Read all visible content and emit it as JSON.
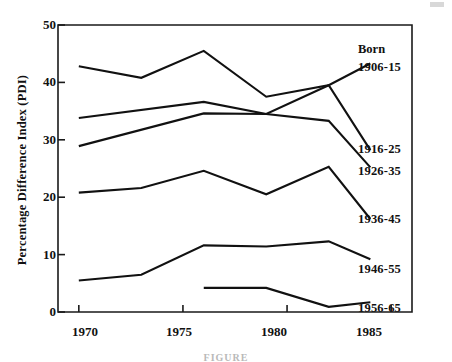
{
  "chart_data": {
    "type": "line",
    "title": "",
    "xlabel": "",
    "ylabel": "Percentage Difference Index (PDI)",
    "xlim": [
      1969,
      1986
    ],
    "ylim": [
      0,
      50
    ],
    "xticks": [
      1970,
      1975,
      1980,
      1985
    ],
    "yticks": [
      0,
      10,
      20,
      30,
      40,
      50
    ],
    "grid": false,
    "legend_position": "right-inline",
    "legend_header": "Born",
    "series": [
      {
        "name": "1906-15",
        "x": [
          1970,
          1973,
          1976,
          1979,
          1982,
          1984
        ],
        "values": [
          42.8,
          40.8,
          45.5,
          37.5,
          39.5,
          28.2
        ]
      },
      {
        "name": "1916-25",
        "x": [
          1970,
          1976,
          1979,
          1982,
          1984
        ],
        "values": [
          33.8,
          36.6,
          34.5,
          33.3,
          25.2
        ]
      },
      {
        "name": "1926-35",
        "x": [
          1970,
          1976,
          1979,
          1982,
          1984
        ],
        "values": [
          28.9,
          34.6,
          34.5,
          39.5,
          43.3
        ]
      },
      {
        "name": "1936-45",
        "x": [
          1970,
          1973,
          1976,
          1979,
          1982,
          1984
        ],
        "values": [
          20.8,
          21.6,
          24.6,
          20.5,
          25.3,
          16.2
        ]
      },
      {
        "name": "1946-55",
        "x": [
          1970,
          1973,
          1976,
          1979,
          1982,
          1984
        ],
        "values": [
          5.5,
          6.5,
          11.6,
          11.4,
          12.3,
          9.2
        ]
      },
      {
        "name": "1956-65",
        "x": [
          1976,
          1979,
          1982,
          1984
        ],
        "values": [
          4.2,
          4.2,
          0.9,
          1.7
        ]
      }
    ]
  },
  "axes": {
    "ylabel": "Percentage Difference Index (PDI)",
    "ytick_labels": [
      "0",
      "10",
      "20",
      "30",
      "40",
      "50"
    ],
    "xtick_labels": [
      "1970",
      "1975",
      "1980",
      "1985"
    ]
  },
  "legend": {
    "header": "Born",
    "top_series": "1906-15",
    "items": [
      "1916-25",
      "1926-35",
      "1936-45",
      "1946-55",
      "1956-65"
    ]
  },
  "caption": {
    "text": "FIGURE"
  },
  "style": {
    "line_color": "#111111",
    "axis_color": "#1a1a1a",
    "background": "#ffffff"
  }
}
